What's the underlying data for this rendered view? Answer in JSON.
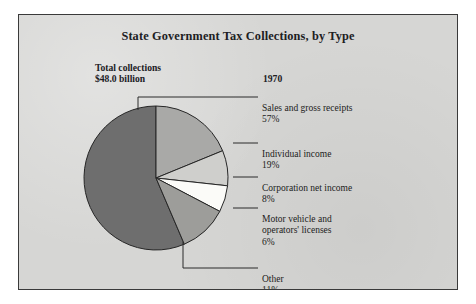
{
  "figure": {
    "title": "State Government Tax Collections, by Type",
    "total_label": "Total collections\n$48.0 billion",
    "year": "1970",
    "background_color": "#d6d6d4",
    "border_color": "#3a3a3a"
  },
  "callouts": [
    {
      "name": "sales-and-gross-receipts",
      "label": "Sales and gross receipts",
      "percent": "57%"
    },
    {
      "name": "individual-income",
      "label": "Individual income",
      "percent": "19%"
    },
    {
      "name": "corporation-net-income",
      "label": "Corporation net income",
      "percent": "8%"
    },
    {
      "name": "motor-vehicle-licenses",
      "label": "Motor vehicle and\noperators' licenses",
      "percent": "6%"
    },
    {
      "name": "other",
      "label": "Other",
      "percent": "11%"
    }
  ],
  "chart_data": {
    "type": "pie",
    "title": "State Government Tax Collections, by Type",
    "subtitle": "Total collections $48.0 billion",
    "annotations": [
      "1970"
    ],
    "total": 48.0,
    "total_units": "billion USD",
    "units": "percent",
    "start_angle_deg": 0,
    "direction": "clockwise",
    "legend": "callout-labels",
    "grid": false,
    "categories": [
      "Sales and gross receipts",
      "Individual income",
      "Corporation net income",
      "Motor vehicle and operators' licenses",
      "Other"
    ],
    "values": [
      57,
      19,
      8,
      6,
      11
    ],
    "labels": [
      "57%",
      "19%",
      "8%",
      "6%",
      "11%"
    ],
    "colors": [
      "#6e6e6e",
      "#a9a9a7",
      "#cfcfcc",
      "#fbfbf8",
      "#9d9d9a"
    ]
  }
}
